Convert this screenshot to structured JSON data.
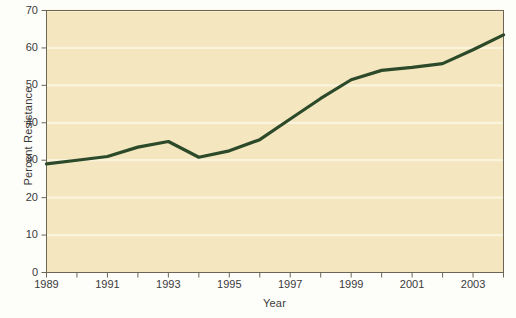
{
  "chart_data": {
    "type": "line",
    "title": "",
    "xlabel": "Year",
    "ylabel": "Percent Resistance",
    "xlim": [
      1989,
      2004
    ],
    "ylim": [
      0,
      70
    ],
    "grid": true,
    "legend": "none",
    "x": [
      1989,
      1990,
      1991,
      1992,
      1993,
      1994,
      1995,
      1996,
      1997,
      1998,
      1999,
      2000,
      2001,
      2002,
      2003,
      2004
    ],
    "values": [
      29,
      30,
      31,
      33.5,
      35,
      30.8,
      32.5,
      35.5,
      41,
      46.5,
      51.5,
      54,
      54.8,
      55.8,
      59.5,
      63.5
    ],
    "series": [
      {
        "name": "Percent Resistance",
        "color": "#2c4a2a",
        "values": [
          29,
          30,
          31,
          33.5,
          35,
          30.8,
          32.5,
          35.5,
          41,
          46.5,
          51.5,
          54,
          54.8,
          55.8,
          59.5,
          63.5
        ]
      }
    ],
    "y_ticks": [
      0,
      10,
      20,
      30,
      40,
      50,
      60,
      70
    ],
    "y_tick_labels": [
      "0",
      "10",
      "20",
      "30",
      "40",
      "50",
      "60",
      "70"
    ],
    "x_major_ticks": [
      1989,
      1991,
      1993,
      1995,
      1997,
      1999,
      2001,
      2003
    ],
    "x_major_tick_labels": [
      "1989",
      "1991",
      "1993",
      "1995",
      "1997",
      "1999",
      "2001",
      "2003"
    ],
    "x_minor_ticks": [
      1990,
      1992,
      1994,
      1996,
      1998,
      2000,
      2002,
      2004
    ],
    "plot_bgcolor": "#f4e6bf",
    "gridline_color": "#fbf4dd",
    "axis_color": "#6d6657",
    "figure_bgcolor": "#fdfdfa"
  }
}
